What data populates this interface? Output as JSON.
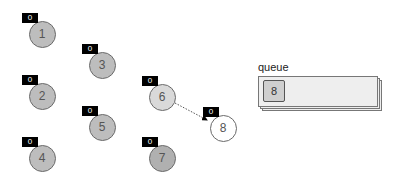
{
  "diagram": {
    "nodes": [
      {
        "id": "1",
        "label": "1",
        "badge": "0",
        "cx": 42,
        "cy": 34,
        "fill": "#bdbdbd"
      },
      {
        "id": "2",
        "label": "2",
        "badge": "0",
        "cx": 42,
        "cy": 96,
        "fill": "#bdbdbd"
      },
      {
        "id": "3",
        "label": "3",
        "badge": "0",
        "cx": 102,
        "cy": 65,
        "fill": "#bdbdbd"
      },
      {
        "id": "4",
        "label": "4",
        "badge": "0",
        "cx": 42,
        "cy": 158,
        "fill": "#bdbdbd"
      },
      {
        "id": "5",
        "label": "5",
        "badge": "0",
        "cx": 102,
        "cy": 127,
        "fill": "#bdbdbd"
      },
      {
        "id": "6",
        "label": "6",
        "badge": "0",
        "cx": 162,
        "cy": 97,
        "fill": "#d9d9d9"
      },
      {
        "id": "7",
        "label": "7",
        "badge": "0",
        "cx": 162,
        "cy": 158,
        "fill": "#b0b0b0"
      },
      {
        "id": "8",
        "label": "8",
        "badge": "0",
        "cx": 223,
        "cy": 128,
        "fill": "#ffffff"
      }
    ],
    "edges": [
      {
        "from": "6",
        "to": "8",
        "style": "dotted",
        "arrow": true
      }
    ],
    "queue": {
      "label": "queue",
      "items": [
        "8"
      ]
    }
  }
}
